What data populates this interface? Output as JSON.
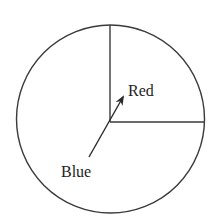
{
  "diagram": {
    "type": "spinner",
    "regions": [
      {
        "label": "Red",
        "fraction": 0.25,
        "description": "upper-right quarter"
      },
      {
        "label": "Blue",
        "fraction": 0.75,
        "description": "remaining three quarters"
      }
    ],
    "labels": {
      "red": "Red",
      "blue": "Blue"
    },
    "colors": {
      "stroke": "#3a3a3a",
      "text": "#1e1e1e",
      "background": "#ffffff"
    }
  }
}
